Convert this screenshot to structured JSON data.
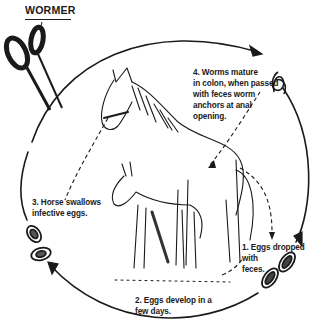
{
  "diagram": {
    "title": "WORMER",
    "steps": [
      {
        "id": 1,
        "text": "1. Eggs dropped\nwith\nfeces."
      },
      {
        "id": 2,
        "text": "2. Eggs develop in a\nfew days."
      },
      {
        "id": 3,
        "text": "3. Horse swallows\ninfective eggs."
      },
      {
        "id": 4,
        "text": "4. Worms mature\nin colon, when passed\nwith feces worm\nanchors at anal\nopening."
      }
    ],
    "icons": {
      "wormer": "scissors-icon",
      "worm": "worm-icon",
      "eggs_dropped": "egg-icon",
      "eggs_infective": "egg-icon",
      "horses": "horse-and-foal-illustration"
    },
    "colors": {
      "ink": "#1a1a1a",
      "background": "#ffffff"
    }
  }
}
